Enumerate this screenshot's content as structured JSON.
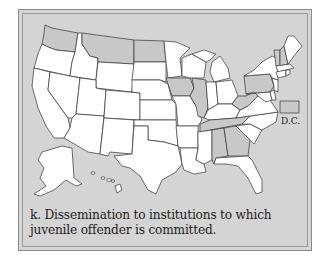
{
  "figure": {
    "caption_line1": "k. Dissemination to institutions to which",
    "caption_line2": "juvenile offender is committed.",
    "dc_label": "D.C."
  },
  "legend": {
    "shaded_meaning": "State permits dissemination (shaded)",
    "colors": {
      "shaded": "#c8c8c8",
      "unshaded": "#ffffff",
      "background": "#d4d4d4",
      "border": "#333333"
    }
  },
  "map_data": {
    "type": "choropleth",
    "region": "United States",
    "shaded_states": [
      "WA",
      "MT",
      "ND",
      "IA",
      "IL",
      "PA",
      "WV",
      "TN",
      "AL",
      "GA",
      "VT",
      "NH",
      "DC"
    ],
    "unshaded_states": [
      "OR",
      "ID",
      "WY",
      "SD",
      "MN",
      "WI",
      "MI",
      "CA",
      "NV",
      "UT",
      "CO",
      "NE",
      "KS",
      "AZ",
      "NM",
      "OK",
      "TX",
      "MO",
      "AR",
      "LA",
      "MS",
      "IN",
      "OH",
      "KY",
      "VA",
      "NC",
      "SC",
      "FL",
      "NY",
      "ME",
      "MA",
      "CT",
      "RI",
      "NJ",
      "DE",
      "MD",
      "AK",
      "HI"
    ]
  }
}
